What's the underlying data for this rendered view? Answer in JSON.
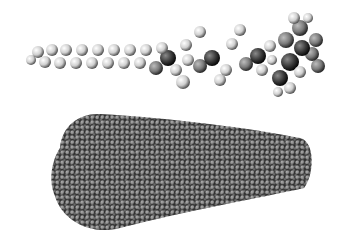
{
  "figure": {
    "panels": [
      {
        "name": "single-molecule",
        "description": "space-filling model of a single amphiphilic molecule with long alkyl tail and bulky head group"
      },
      {
        "name": "micelle-aggregate",
        "description": "space-filling model of an elongated conical assembly of many molecules"
      }
    ],
    "colors": {
      "light_atom": "#e8e8e8",
      "mid_atom": "#8a8a8a",
      "dark_atom": "#2a2a2a",
      "background": "#ffffff"
    }
  }
}
